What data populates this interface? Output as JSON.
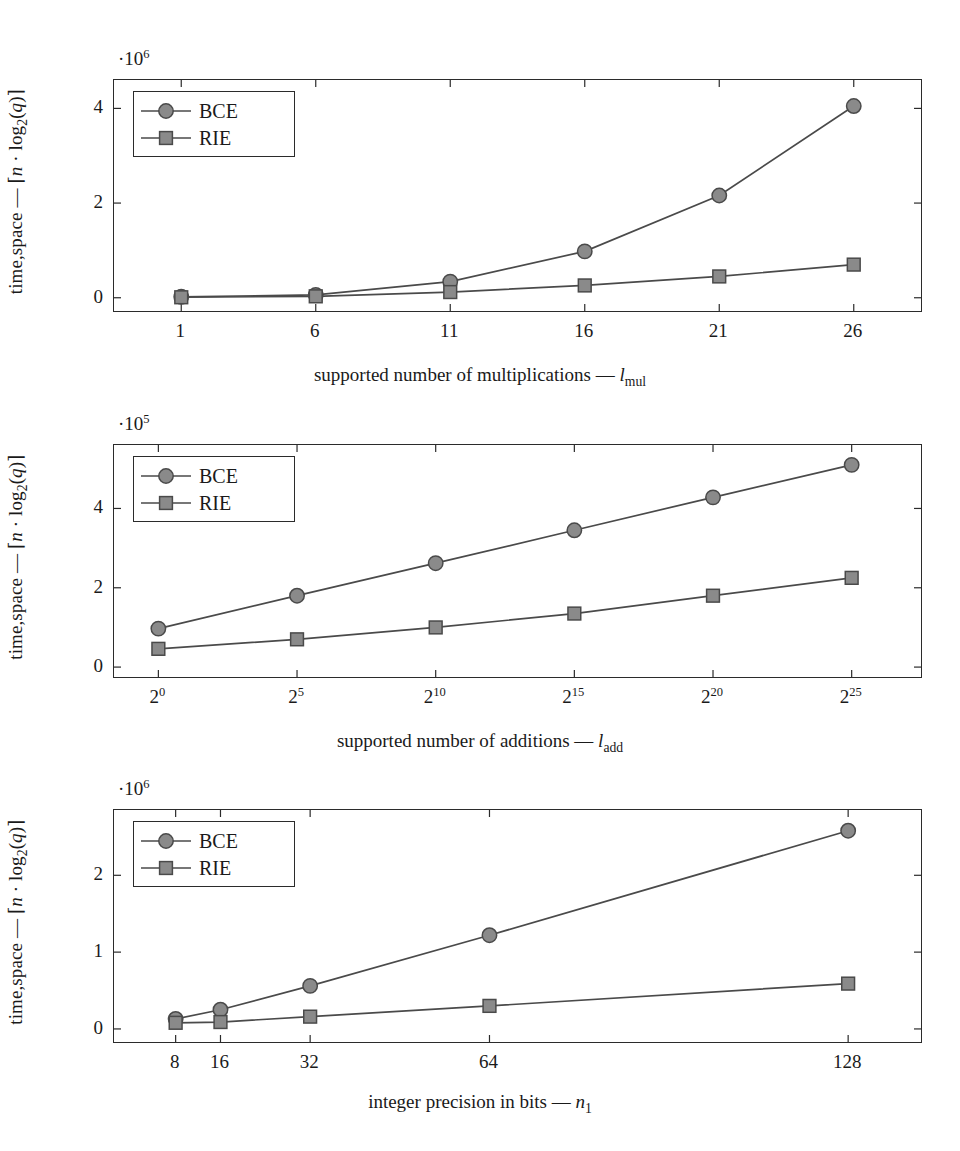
{
  "figure": {
    "title": "",
    "background_color": "#ffffff",
    "axis_color": "#2b2b2b",
    "series_colors": {
      "BCE": "#8a8a8a",
      "RIE": "#8a8a8a"
    },
    "marker_stroke": "#4a4a4a",
    "line_color": "#4a4a4a"
  },
  "chart_data": [
    {
      "type": "line",
      "id": "multiplications",
      "title": "",
      "xlabel": "supported number of multiplications — l_mul",
      "xlabel_text": "supported number of multiplications — ",
      "xlabel_symbol": "l",
      "xlabel_symbol_sub": "mul",
      "ylabel": "time,space — ⌈n · log₂(q)⌉",
      "y_exponent": "·10",
      "y_exponent_sup": "6",
      "y_scale": 1000000,
      "categories": [
        "1",
        "6",
        "11",
        "16",
        "21",
        "26"
      ],
      "x": [
        1,
        6,
        11,
        16,
        21,
        26
      ],
      "xticklabels": [
        "1",
        "6",
        "11",
        "16",
        "21",
        "26"
      ],
      "xlim": [
        -1.5,
        28.5
      ],
      "ylim": [
        -0.28,
        4.6
      ],
      "yticks": [
        0,
        2,
        4
      ],
      "yticklabels": [
        "0",
        "2",
        "4"
      ],
      "grid": false,
      "legend_position": "upper-left",
      "series": [
        {
          "name": "BCE",
          "marker": "circle",
          "values": [
            0.02,
            0.06,
            0.34,
            0.98,
            2.16,
            4.05
          ]
        },
        {
          "name": "RIE",
          "marker": "square",
          "values": [
            0.01,
            0.03,
            0.12,
            0.26,
            0.45,
            0.7
          ]
        }
      ]
    },
    {
      "type": "line",
      "id": "additions",
      "title": "",
      "xlabel": "supported number of additions — l_add",
      "xlabel_text": "supported number of additions — ",
      "xlabel_symbol": "l",
      "xlabel_symbol_sub": "add",
      "ylabel": "time,space — ⌈n · log₂(q)⌉",
      "y_exponent": "·10",
      "y_exponent_sup": "5",
      "y_scale": 100000,
      "categories": [
        "2^0",
        "2^5",
        "2^10",
        "2^15",
        "2^20",
        "2^25"
      ],
      "x": [
        0,
        5,
        10,
        15,
        20,
        25
      ],
      "xticklabels": [
        "2",
        "2",
        "2",
        "2",
        "2",
        "2"
      ],
      "xtick_sups": [
        "0",
        "5",
        "10",
        "15",
        "20",
        "25"
      ],
      "xlim": [
        -1.6,
        27.5
      ],
      "ylim": [
        -0.25,
        5.6
      ],
      "yticks": [
        0,
        2,
        4
      ],
      "yticklabels": [
        "0",
        "2",
        "4"
      ],
      "grid": false,
      "legend_position": "upper-left",
      "series": [
        {
          "name": "BCE",
          "marker": "circle",
          "values": [
            0.97,
            1.8,
            2.62,
            3.45,
            4.28,
            5.1
          ]
        },
        {
          "name": "RIE",
          "marker": "square",
          "values": [
            0.46,
            0.7,
            1.0,
            1.35,
            1.8,
            2.25
          ]
        }
      ]
    },
    {
      "type": "line",
      "id": "precision",
      "title": "",
      "xlabel": "integer precision in bits — n_1",
      "xlabel_text": "integer precision in bits — ",
      "xlabel_symbol": "n",
      "xlabel_symbol_sub": "1",
      "ylabel": "time,space — ⌈n · log₂(q)⌉",
      "y_exponent": "·10",
      "y_exponent_sup": "6",
      "y_scale": 1000000,
      "categories": [
        "8",
        "16",
        "32",
        "64",
        "128"
      ],
      "x": [
        8,
        16,
        32,
        64,
        128
      ],
      "xticklabels": [
        "8",
        "16",
        "32",
        "64",
        "128"
      ],
      "xlim": [
        -3,
        141
      ],
      "ylim": [
        -0.17,
        2.85
      ],
      "yticks": [
        0,
        1,
        2
      ],
      "yticklabels": [
        "0",
        "1",
        "2"
      ],
      "grid": false,
      "legend_position": "upper-left",
      "series": [
        {
          "name": "BCE",
          "marker": "circle",
          "values": [
            0.13,
            0.25,
            0.56,
            1.22,
            2.58
          ]
        },
        {
          "name": "RIE",
          "marker": "square",
          "values": [
            0.08,
            0.09,
            0.16,
            0.3,
            0.59
          ]
        }
      ]
    }
  ],
  "legend": {
    "entries": [
      {
        "label": "BCE",
        "marker": "circle"
      },
      {
        "label": "RIE",
        "marker": "square"
      }
    ]
  }
}
